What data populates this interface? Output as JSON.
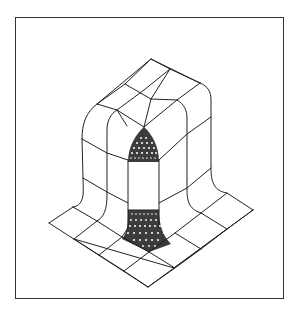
{
  "figure": {
    "colors": {
      "line": "#222222",
      "frame": "#333333",
      "background": "#ffffff"
    },
    "base_grid": {
      "cells_per_side": 4,
      "pillar_cells_per_side": 2
    },
    "refined_regions": [
      "front-top-corner-dome",
      "front-bottom-fillet"
    ]
  }
}
